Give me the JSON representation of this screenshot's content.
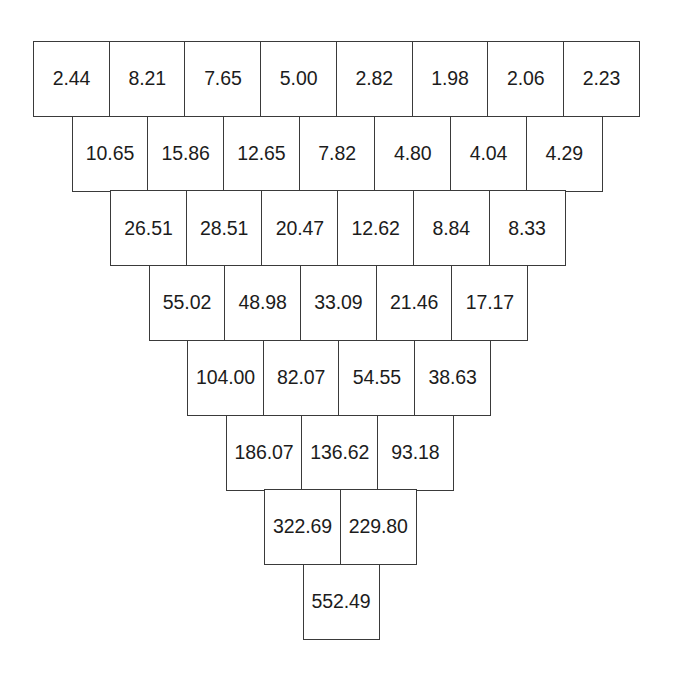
{
  "diagram": {
    "name": "run-off-triangle",
    "title": "",
    "shape": "inverted-pyramid",
    "row_count": 8,
    "cell_width_px": 77,
    "cell_height_px": 76,
    "row_stagger_px": 38.5,
    "origin": {
      "x": 33,
      "y": 41
    },
    "colors": {
      "background": "#ffffff",
      "cell_fill": "#ffffff",
      "border": "#3a3a3a",
      "text": "#1c1c1c"
    }
  },
  "chart_data": {
    "type": "table",
    "title": "",
    "xlabel": "",
    "ylabel": "",
    "rows": [
      {
        "index": 1,
        "offset_cells": 0.0,
        "values": [
          "2.44",
          "8.21",
          "7.65",
          "5.00",
          "2.82",
          "1.98",
          "2.06",
          "2.23"
        ]
      },
      {
        "index": 2,
        "offset_cells": 0.5,
        "values": [
          "10.65",
          "15.86",
          "12.65",
          "7.82",
          "4.80",
          "4.04",
          "4.29"
        ]
      },
      {
        "index": 3,
        "offset_cells": 1.0,
        "values": [
          "26.51",
          "28.51",
          "20.47",
          "12.62",
          "8.84",
          "8.33"
        ]
      },
      {
        "index": 4,
        "offset_cells": 1.5,
        "values": [
          "55.02",
          "48.98",
          "33.09",
          "21.46",
          "17.17"
        ]
      },
      {
        "index": 5,
        "offset_cells": 2.0,
        "values": [
          "104.00",
          "82.07",
          "54.55",
          "38.63"
        ]
      },
      {
        "index": 6,
        "offset_cells": 2.5,
        "values": [
          "186.07",
          "136.62",
          "93.18"
        ]
      },
      {
        "index": 7,
        "offset_cells": 3.0,
        "values": [
          "322.69",
          "229.80"
        ]
      },
      {
        "index": 8,
        "offset_cells": 3.5,
        "values": [
          "552.49"
        ]
      }
    ]
  }
}
